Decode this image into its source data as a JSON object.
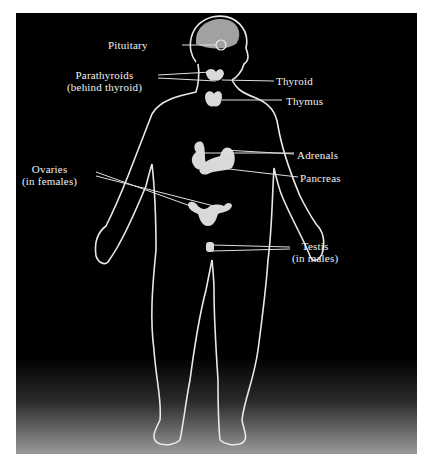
{
  "diagram": {
    "colors": {
      "background": "#000000",
      "outline": "#e8e8e8",
      "organ": "#d9d9d9",
      "label_text": "#f0f0f0",
      "border": "#ffffff"
    },
    "labels": {
      "pituitary": "Pituitary",
      "parathyroids": "Parathyroids",
      "parathyroids_note": "(behind thyroid)",
      "thyroid": "Thyroid",
      "thymus": "Thymus",
      "adrenals": "Adrenals",
      "pancreas": "Pancreas",
      "ovaries": "Ovaries",
      "ovaries_note": "(in females)",
      "testis": "Testis",
      "testis_note": "(in males)"
    }
  }
}
